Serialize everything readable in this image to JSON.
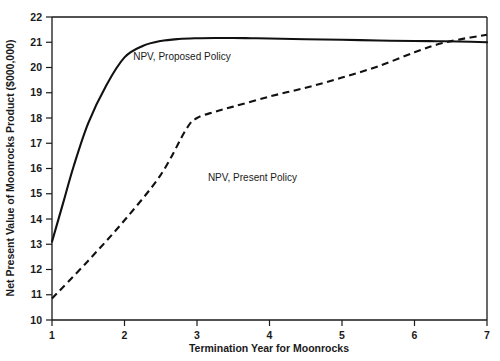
{
  "chart_data": {
    "type": "line",
    "title": "",
    "xlabel": "Termination Year for Moonrocks",
    "ylabel": "Net Present Value of Moonrocks Product ($000,000)",
    "xlim": [
      1,
      7
    ],
    "ylim": [
      10,
      22
    ],
    "xticks": [
      1,
      2,
      3,
      4,
      5,
      6,
      7
    ],
    "xtick_labels": [
      "1",
      "2",
      "3",
      "4",
      "5",
      "6",
      "7"
    ],
    "yticks": [
      10,
      11,
      12,
      13,
      14,
      15,
      16,
      17,
      18,
      19,
      20,
      21,
      22
    ],
    "ytick_labels": [
      "10",
      "11",
      "12",
      "13",
      "14",
      "15",
      "16",
      "17",
      "18",
      "19",
      "20",
      "21",
      "22"
    ],
    "grid": false,
    "legend_position": "inline-annotation",
    "series": [
      {
        "name": "NPV, Proposed Policy",
        "style": "solid",
        "color": "#111111",
        "label_x": 2.12,
        "label_y": 20.3,
        "x": [
          1.0,
          1.15,
          1.3,
          1.5,
          1.75,
          2.0,
          2.25,
          2.5,
          2.75,
          3.0,
          3.25,
          3.5,
          3.75,
          4.0,
          4.5,
          5.0,
          5.5,
          6.0,
          6.3,
          6.6,
          7.0
        ],
        "y": [
          13.1,
          14.6,
          16.1,
          17.8,
          19.3,
          20.4,
          20.85,
          21.05,
          21.13,
          21.16,
          21.17,
          21.17,
          21.16,
          21.15,
          21.12,
          21.1,
          21.07,
          21.05,
          21.04,
          21.03,
          21.0
        ]
      },
      {
        "name": "NPV, Present Policy",
        "style": "dashed",
        "color": "#111111",
        "label_x": 3.15,
        "label_y": 15.5,
        "x": [
          1.0,
          1.5,
          2.0,
          2.5,
          2.85,
          3.0,
          3.25,
          3.5,
          4.0,
          4.5,
          5.0,
          5.5,
          6.0,
          6.3,
          6.6,
          7.0
        ],
        "y": [
          10.85,
          12.35,
          13.95,
          15.75,
          17.55,
          18.0,
          18.25,
          18.45,
          18.85,
          19.2,
          19.6,
          20.05,
          20.6,
          20.9,
          21.1,
          21.3
        ]
      }
    ]
  },
  "axes": {
    "x_title": "Termination Year for Moonrocks",
    "y_title": "Net Present Value of Moonrocks Product ($000,000)"
  },
  "colors": {
    "foreground": "#111111",
    "background": "#ffffff"
  }
}
